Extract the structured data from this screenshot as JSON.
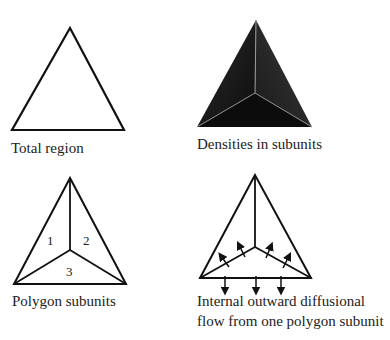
{
  "panels": {
    "total_region": {
      "label": "Total region"
    },
    "densities": {
      "label": "Densities in subunits"
    },
    "polygon_subunits": {
      "label": "Polygon subunits",
      "numbers": [
        "1",
        "2",
        "3"
      ]
    },
    "diffusional_flow": {
      "label_line1": "Internal outward diffusional",
      "label_line2": "flow from one polygon subunit"
    }
  },
  "colors": {
    "stroke": "#111111",
    "fill_dark": "#141414",
    "background": "#ffffff"
  }
}
